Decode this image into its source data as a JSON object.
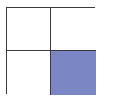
{
  "diagram": {
    "type": "fraction-grid",
    "rows": 2,
    "columns": 2,
    "cells": [
      {
        "row": 0,
        "col": 0,
        "shaded": false
      },
      {
        "row": 0,
        "col": 1,
        "shaded": false
      },
      {
        "row": 1,
        "col": 0,
        "shaded": false
      },
      {
        "row": 1,
        "col": 1,
        "shaded": true
      }
    ],
    "shaded_count": 1,
    "total_count": 4,
    "colors": {
      "shade": "#7b86c4",
      "border": "#3a3a3a",
      "background": "#ffffff"
    }
  }
}
